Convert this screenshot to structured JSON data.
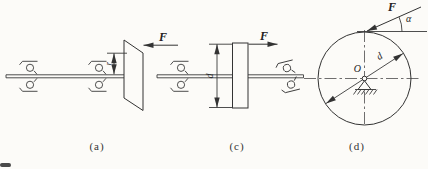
{
  "figure": {
    "background": "#fcfbf8",
    "ink": "#333333",
    "subfigures": [
      {
        "label": "(a)",
        "force_label": "F",
        "radius_label": "r"
      },
      {
        "label": "(c)",
        "force_label": "F",
        "diameter_label": "d"
      },
      {
        "label": "(d)",
        "force_label": "F",
        "angle_label": "α",
        "diameter_label": "d",
        "center_label": "O"
      }
    ]
  }
}
